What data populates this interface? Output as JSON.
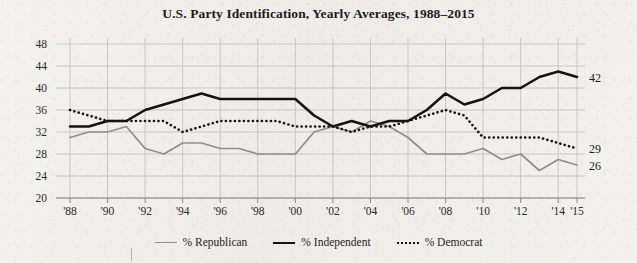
{
  "chart_data": {
    "type": "line",
    "title": "U.S. Party Identification, Yearly Averages, 1988–2015",
    "xlabel": "",
    "ylabel": "",
    "ylim": [
      20,
      48
    ],
    "ytick_step": 4,
    "yticks": [
      20,
      24,
      28,
      32,
      36,
      40,
      44,
      48
    ],
    "xticks": [
      "'88",
      "'90",
      "'92",
      "'94",
      "'96",
      "'98",
      "'00",
      "'02",
      "'04",
      "'06",
      "'08",
      "'10",
      "'12",
      "'14",
      "'15"
    ],
    "x": [
      1988,
      1989,
      1990,
      1991,
      1992,
      1993,
      1994,
      1995,
      1996,
      1997,
      1998,
      1999,
      2000,
      2001,
      2002,
      2003,
      2004,
      2005,
      2006,
      2007,
      2008,
      2009,
      2010,
      2011,
      2012,
      2013,
      2014,
      2015
    ],
    "grid": true,
    "legend_position": "bottom-center",
    "series": [
      {
        "name": "% Republican",
        "color": "#8e8e8e",
        "style": "solid",
        "end_label": "26",
        "values": [
          31,
          32,
          32,
          33,
          29,
          28,
          30,
          30,
          29,
          29,
          28,
          28,
          28,
          32,
          33,
          32,
          34,
          33,
          31,
          28,
          28,
          28,
          29,
          27,
          28,
          25,
          27,
          26
        ]
      },
      {
        "name": "% Independent",
        "color": "#141414",
        "style": "solid",
        "end_label": "42",
        "values": [
          33,
          33,
          34,
          34,
          36,
          37,
          38,
          39,
          38,
          38,
          38,
          38,
          38,
          35,
          33,
          34,
          33,
          34,
          34,
          36,
          39,
          37,
          38,
          40,
          40,
          42,
          43,
          42
        ]
      },
      {
        "name": "% Democrat",
        "color": "#141414",
        "style": "dotted",
        "end_label": "29",
        "values": [
          36,
          35,
          34,
          34,
          34,
          34,
          32,
          33,
          34,
          34,
          34,
          34,
          33,
          33,
          33,
          32,
          33,
          33,
          34,
          35,
          36,
          35,
          31,
          31,
          31,
          31,
          30,
          29
        ]
      }
    ]
  },
  "legend": {
    "items": [
      {
        "label": "% Republican",
        "swatch": "republican-line-swatch"
      },
      {
        "label": "% Independent",
        "swatch": "independent-line-swatch"
      },
      {
        "label": "% Democrat",
        "swatch": "democrat-dotted-swatch"
      }
    ]
  },
  "colors": {
    "background": "#f2f0ec",
    "grid": "#c9c6c1",
    "axis": "#8c8880",
    "republican": "#8e8e8e",
    "independent": "#141414",
    "democrat": "#141414",
    "text": "#1a1a1a"
  }
}
